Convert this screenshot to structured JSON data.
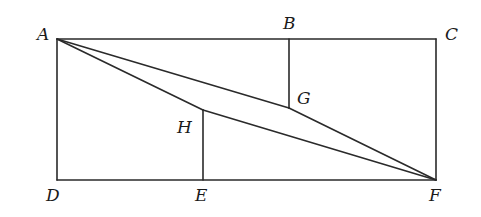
{
  "figure": {
    "labels": {
      "A": "A",
      "B": "B",
      "C": "C",
      "D": "D",
      "E": "E",
      "F": "F",
      "G": "G",
      "H": "H"
    },
    "segments": [
      "AC",
      "CF",
      "FD",
      "DA",
      "BG",
      "EH",
      "AG",
      "GF",
      "AH",
      "HF"
    ],
    "colors": {
      "line": "#2a2a2a",
      "label": "#1a1a1a",
      "background": "#ffffff"
    }
  }
}
